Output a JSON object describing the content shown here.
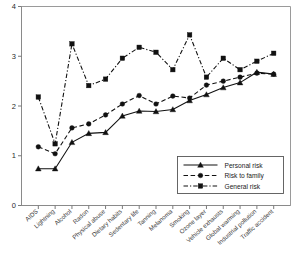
{
  "chart_data": {
    "type": "line",
    "title": "",
    "subtitle": "",
    "xlabel": "",
    "ylabel": "",
    "ylim": [
      0,
      4
    ],
    "yticks": [
      0,
      1,
      2,
      3,
      4
    ],
    "ytick_labels": [
      "0",
      "1",
      "2",
      "3",
      "4"
    ],
    "grid": false,
    "legend_position": "bottom-right",
    "categories": [
      "AIDS",
      "Lightning",
      "Alcohol",
      "Radon",
      "Physical abuse",
      "Dietary habits",
      "Sedentary life",
      "Tanning",
      "Melanoma",
      "Smoking",
      "Ozone layer",
      "Vehicle exhausts",
      "Global warming",
      "Industrial pollution",
      "Traffic accident"
    ],
    "series": [
      {
        "name": "Personal risk",
        "marker": "triangle",
        "linestyle": "solid",
        "values": [
          0.74,
          0.74,
          1.27,
          1.45,
          1.47,
          1.8,
          1.9,
          1.89,
          1.93,
          2.11,
          2.23,
          2.37,
          2.47,
          2.68,
          2.64
        ]
      },
      {
        "name": "Risk to family",
        "marker": "circle",
        "linestyle": "dashed",
        "values": [
          1.18,
          1.04,
          1.56,
          1.64,
          1.82,
          2.04,
          2.21,
          2.04,
          2.2,
          2.16,
          2.42,
          2.5,
          2.58,
          2.66,
          2.64
        ]
      },
      {
        "name": "General risk",
        "marker": "square",
        "linestyle": "dash-dot",
        "values": [
          2.18,
          1.24,
          3.25,
          2.41,
          2.54,
          2.96,
          3.18,
          3.08,
          2.73,
          3.43,
          2.58,
          2.96,
          2.73,
          2.9,
          3.06
        ]
      }
    ]
  },
  "legend": {
    "entries": [
      {
        "label": "Personal risk"
      },
      {
        "label": "Risk to family"
      },
      {
        "label": "General risk"
      }
    ]
  },
  "colors": {
    "ink": "#111111",
    "frame": "#9a9a9a",
    "background": "#ffffff"
  }
}
